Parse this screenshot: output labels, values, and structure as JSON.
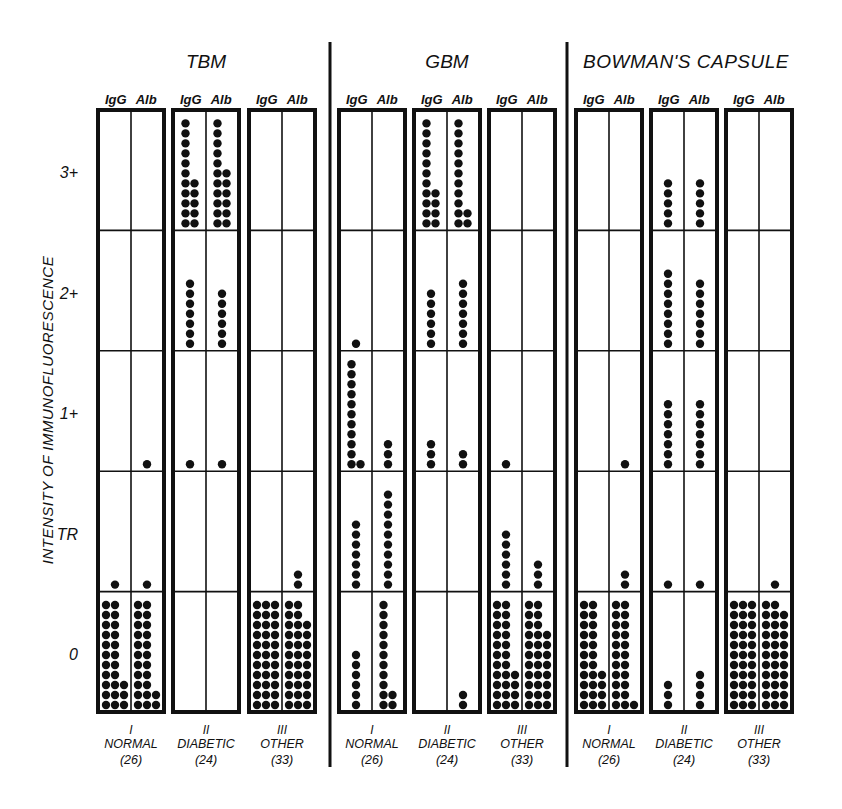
{
  "chart_data": {
    "type": "dot-plot",
    "ylabel": "INTENSITY OF IMMUNOFLUORESCENCE",
    "y_levels": [
      "0",
      "TR",
      "1+",
      "2+",
      "3+"
    ],
    "y_tick_labels": [
      "3+",
      "2+",
      "1+",
      "TR",
      "0"
    ],
    "stains": [
      "IgG",
      "Alb"
    ],
    "groups": [
      {
        "numeral": "I",
        "name": "NORMAL",
        "n_label": "(26)",
        "n": 26
      },
      {
        "numeral": "II",
        "name": "DIABETIC",
        "n_label": "(24)",
        "n": 24
      },
      {
        "numeral": "III",
        "name": "OTHER",
        "n_label": "(33)",
        "n": 33
      }
    ],
    "panels": [
      {
        "title": "TBM",
        "groups": [
          {
            "group": "NORMAL",
            "IgG": {
              "0": 25,
              "TR": 1,
              "1+": 0,
              "2+": 0,
              "3+": 0
            },
            "Alb": {
              "0": 24,
              "TR": 1,
              "1+": 1,
              "2+": 0,
              "3+": 0
            }
          },
          {
            "group": "DIABETIC",
            "IgG": {
              "0": 0,
              "TR": 0,
              "1+": 1,
              "2+": 7,
              "3+": 16
            },
            "Alb": {
              "0": 0,
              "TR": 0,
              "1+": 1,
              "2+": 6,
              "3+": 17
            }
          },
          {
            "group": "OTHER",
            "IgG": {
              "0": 33,
              "TR": 0,
              "1+": 0,
              "2+": 0,
              "3+": 0
            },
            "Alb": {
              "0": 31,
              "TR": 2,
              "1+": 0,
              "2+": 0,
              "3+": 0
            }
          }
        ]
      },
      {
        "title": "GBM",
        "groups": [
          {
            "group": "NORMAL",
            "IgG": {
              "0": 6,
              "TR": 7,
              "1+": 12,
              "2+": 1,
              "3+": 0
            },
            "Alb": {
              "0": 13,
              "TR": 10,
              "1+": 3,
              "2+": 0,
              "3+": 0
            }
          },
          {
            "group": "DIABETIC",
            "IgG": {
              "0": 0,
              "TR": 0,
              "1+": 3,
              "2+": 6,
              "3+": 15
            },
            "Alb": {
              "0": 2,
              "TR": 0,
              "1+": 2,
              "2+": 7,
              "3+": 13
            }
          },
          {
            "group": "OTHER",
            "IgG": {
              "0": 26,
              "TR": 6,
              "1+": 1,
              "2+": 0,
              "3+": 0
            },
            "Alb": {
              "0": 30,
              "TR": 3,
              "1+": 0,
              "2+": 0,
              "3+": 0
            }
          }
        ]
      },
      {
        "title": "BOWMAN'S CAPSULE",
        "groups": [
          {
            "group": "NORMAL",
            "IgG": {
              "0": 26,
              "TR": 0,
              "1+": 0,
              "2+": 0,
              "3+": 0
            },
            "Alb": {
              "0": 23,
              "TR": 2,
              "1+": 1,
              "2+": 0,
              "3+": 0
            }
          },
          {
            "group": "DIABETIC",
            "IgG": {
              "0": 3,
              "TR": 1,
              "1+": 7,
              "2+": 8,
              "3+": 5
            },
            "Alb": {
              "0": 4,
              "TR": 1,
              "1+": 7,
              "2+": 7,
              "3+": 5
            }
          },
          {
            "group": "OTHER",
            "IgG": {
              "0": 33,
              "TR": 0,
              "1+": 0,
              "2+": 0,
              "3+": 0
            },
            "Alb": {
              "0": 32,
              "TR": 1,
              "1+": 0,
              "2+": 0,
              "3+": 0
            }
          }
        ]
      }
    ],
    "colors": {
      "ink": "#111111",
      "background": "#ffffff"
    }
  }
}
